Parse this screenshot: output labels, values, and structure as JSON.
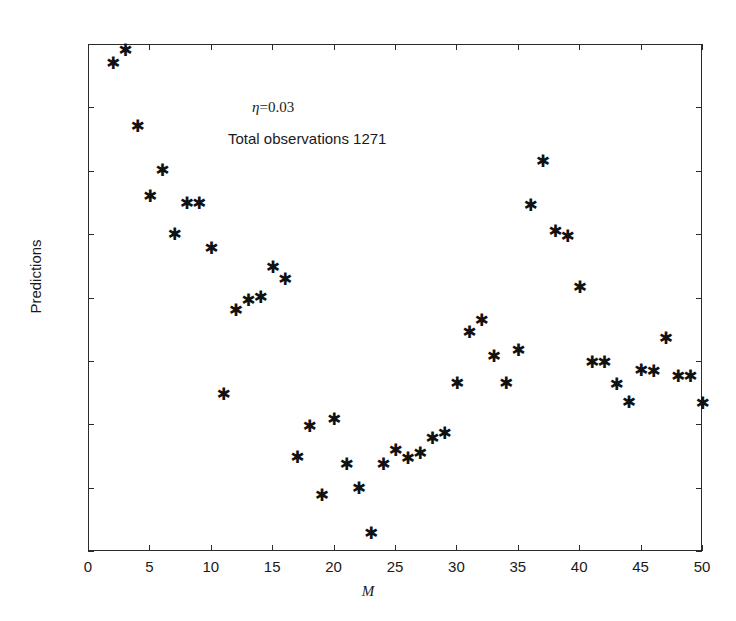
{
  "chart_data": {
    "type": "scatter",
    "title": "",
    "xlabel": "M",
    "ylabel": "Predictions",
    "xlim": [
      0,
      50
    ],
    "ylim": [
      610,
      690
    ],
    "xticks": [
      0,
      5,
      10,
      15,
      20,
      25,
      30,
      35,
      40,
      45,
      50
    ],
    "yticks": [
      610,
      620,
      630,
      640,
      650,
      660,
      670,
      680,
      690
    ],
    "grid": false,
    "legend": null,
    "marker": "asterisk",
    "marker_color": "#111111",
    "annotations": [
      {
        "text": "η=0.03",
        "symbol": "η",
        "value": "=0.03",
        "x": 14.0,
        "y": 675.0
      },
      {
        "text": "Total observations 1271",
        "x": 13.0,
        "y": 670.0
      }
    ],
    "x": [
      2,
      3,
      4,
      5,
      6,
      7,
      8,
      9,
      10,
      11,
      12,
      13,
      14,
      15,
      16,
      17,
      18,
      19,
      20,
      21,
      22,
      23,
      24,
      25,
      26,
      27,
      28,
      29,
      30,
      31,
      32,
      33,
      34,
      35,
      36,
      37,
      38,
      39,
      40,
      41,
      42,
      43,
      44,
      45,
      46,
      47,
      48,
      49,
      50
    ],
    "y": [
      687.0,
      689.0,
      677.0,
      666.0,
      670.0,
      660.0,
      664.8,
      664.8,
      657.8,
      634.7,
      648.0,
      649.6,
      650.0,
      654.7,
      652.8,
      624.8,
      629.7,
      618.7,
      630.8,
      623.6,
      619.8,
      612.7,
      623.7,
      625.9,
      624.6,
      625.4,
      627.7,
      628.6,
      636.5,
      644.5,
      646.3,
      640.7,
      636.4,
      641.7,
      664.5,
      671.4,
      660.4,
      659.6,
      651.5,
      639.7,
      639.7,
      636.3,
      633.4,
      638.5,
      638.4,
      643.5,
      637.6,
      637.6,
      633.3
    ],
    "points": [
      {
        "x": 2,
        "y": 687.0
      },
      {
        "x": 3,
        "y": 689.0
      },
      {
        "x": 4,
        "y": 677.0
      },
      {
        "x": 5,
        "y": 666.0
      },
      {
        "x": 6,
        "y": 670.0
      },
      {
        "x": 7,
        "y": 660.0
      },
      {
        "x": 8,
        "y": 664.8
      },
      {
        "x": 9,
        "y": 664.8
      },
      {
        "x": 10,
        "y": 657.8
      },
      {
        "x": 11,
        "y": 634.7
      },
      {
        "x": 12,
        "y": 648.0
      },
      {
        "x": 13,
        "y": 649.6
      },
      {
        "x": 14,
        "y": 650.0
      },
      {
        "x": 15,
        "y": 654.7
      },
      {
        "x": 16,
        "y": 652.8
      },
      {
        "x": 17,
        "y": 624.8
      },
      {
        "x": 18,
        "y": 629.7
      },
      {
        "x": 19,
        "y": 618.7
      },
      {
        "x": 20,
        "y": 630.8
      },
      {
        "x": 21,
        "y": 623.6
      },
      {
        "x": 22,
        "y": 619.8
      },
      {
        "x": 23,
        "y": 612.7
      },
      {
        "x": 24,
        "y": 623.7
      },
      {
        "x": 25,
        "y": 625.9
      },
      {
        "x": 26,
        "y": 624.6
      },
      {
        "x": 27,
        "y": 625.4
      },
      {
        "x": 28,
        "y": 627.7
      },
      {
        "x": 29,
        "y": 628.6
      },
      {
        "x": 30,
        "y": 636.5
      },
      {
        "x": 31,
        "y": 644.5
      },
      {
        "x": 32,
        "y": 646.3
      },
      {
        "x": 33,
        "y": 640.7
      },
      {
        "x": 34,
        "y": 636.4
      },
      {
        "x": 35,
        "y": 641.7
      },
      {
        "x": 36,
        "y": 664.5
      },
      {
        "x": 37,
        "y": 671.4
      },
      {
        "x": 38,
        "y": 660.4
      },
      {
        "x": 39,
        "y": 659.6
      },
      {
        "x": 40,
        "y": 651.5
      },
      {
        "x": 41,
        "y": 639.7
      },
      {
        "x": 42,
        "y": 639.7
      },
      {
        "x": 43,
        "y": 636.3
      },
      {
        "x": 44,
        "y": 633.4
      },
      {
        "x": 45,
        "y": 638.5
      },
      {
        "x": 46,
        "y": 638.4
      },
      {
        "x": 47,
        "y": 643.5
      },
      {
        "x": 48,
        "y": 637.6
      },
      {
        "x": 49,
        "y": 637.6
      },
      {
        "x": 50,
        "y": 633.3
      }
    ]
  },
  "axis": {
    "xlabel": "M",
    "ylabel": "Predictions",
    "xtick_labels": [
      "0",
      "5",
      "10",
      "15",
      "20",
      "25",
      "30",
      "35",
      "40",
      "45",
      "50"
    ],
    "ytick_labels": [
      "610",
      "620",
      "630",
      "640",
      "650",
      "660",
      "670",
      "680",
      "690"
    ]
  },
  "annotations": {
    "eta_symbol": "η",
    "eta_value": "=0.03",
    "eta_full": "η=0.03",
    "observations": "Total observations 1271"
  },
  "marker_glyph": "✱"
}
